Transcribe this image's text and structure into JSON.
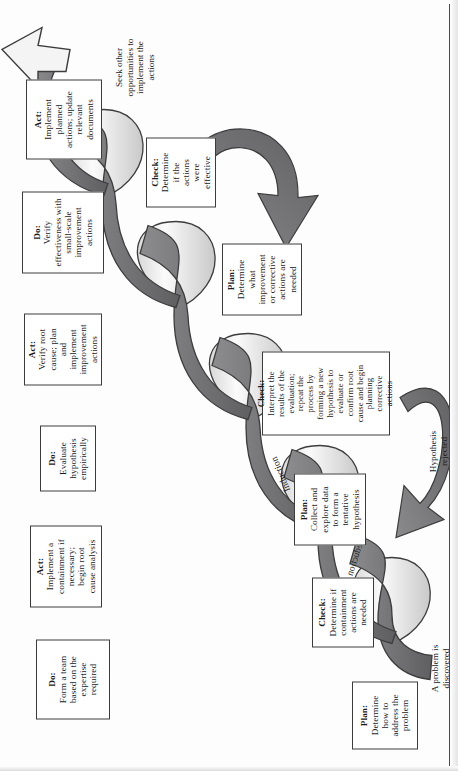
{
  "figure": {
    "type": "spiral-pdca-diagram",
    "title_visible": false,
    "colors": {
      "ribbon_dark": "#78787a",
      "ribbon_light": "#f2f2f2",
      "outline": "#3c3c3c",
      "arrow_fill": "#6e6e70",
      "page": "#ffffff"
    },
    "band_labels": {
      "induction": "Induction",
      "deduction": "Deduction"
    },
    "annotations": {
      "problem_discovered": "A problem is\ndiscovered",
      "hypothesis_rejected": "Hypothesis\nrejected",
      "seek_other": "Seek other\nopportunities to\nimplement the\nactions"
    },
    "boxes_lower": [
      {
        "id": "plan-1",
        "heading": "Plan:",
        "body": "Determine\nhow to\naddress the\nproblem"
      },
      {
        "id": "check-1",
        "heading": "Check:",
        "body": "Determine if\ncontainment\nactions are\nneeded"
      },
      {
        "id": "plan-2",
        "heading": "Plan:",
        "body": "Collect and\nexplore data\nto form a\ntentative\nhypothesis"
      },
      {
        "id": "check-2",
        "heading": "Check:",
        "body": "Interpret the\nresults of the\nevaluation;\nrepeat the\nprocess by\nforming a new\nhypothesis to\nevaluate or\nconfirm root\ncause and begin\nplanning\ncorrective\nactions"
      },
      {
        "id": "plan-3",
        "heading": "Plan:",
        "body": "Determine\nwhat\nimprovement\nor corrective\nactions are\nneeded"
      },
      {
        "id": "check-3",
        "heading": "Check:",
        "body": "Determine\nif the\nactions\nwere\neffective"
      }
    ],
    "boxes_upper": [
      {
        "id": "do-1",
        "heading": "Do:",
        "body": "Form a team\nbased on the\nexpertise\nrequired"
      },
      {
        "id": "act-1",
        "heading": "Act:",
        "body": "Implement a\ncontainment if\nnecessary;\nbegin root\ncause analysis"
      },
      {
        "id": "do-2",
        "heading": "Do:",
        "body": "Evaluate\nhypothesis\nempirically"
      },
      {
        "id": "act-2",
        "heading": "Act:",
        "body": "Verify root\ncause; plan\nand\nimplement\nimprovement\nactions"
      },
      {
        "id": "do-3",
        "heading": "Do:",
        "body": "Verify\neffectiveness with\nsmall-scale\nimprovement\nactions"
      },
      {
        "id": "act-3",
        "heading": "Act:",
        "body": "Implement\nplanned\nactions; update\nrelevant\ndocuments"
      }
    ]
  }
}
